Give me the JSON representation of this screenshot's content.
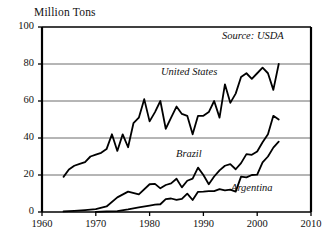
{
  "chart_data": {
    "type": "line",
    "title": "",
    "ylabel": "Million Tons",
    "xlabel": "",
    "annotation": "Source: USDA",
    "xlim": [
      1960,
      2010
    ],
    "ylim": [
      0,
      100
    ],
    "yticks": [
      0,
      20,
      40,
      60,
      80,
      100
    ],
    "xticks": [
      1960,
      1970,
      1980,
      1990,
      2000,
      2010
    ],
    "grid": "horizontal",
    "legend": "inline-labels",
    "series": [
      {
        "name": "United States",
        "x": [
          1964,
          1965,
          1966,
          1967,
          1968,
          1969,
          1970,
          1971,
          1972,
          1973,
          1974,
          1975,
          1976,
          1977,
          1978,
          1979,
          1980,
          1981,
          1982,
          1983,
          1984,
          1985,
          1986,
          1987,
          1988,
          1989,
          1990,
          1991,
          1992,
          1993,
          1994,
          1995,
          1996,
          1997,
          1998,
          1999,
          2000,
          2001,
          2002,
          2003,
          2004
        ],
        "values": [
          19,
          23,
          25,
          26,
          27,
          30,
          31,
          32,
          34,
          42,
          33,
          42,
          35,
          48,
          51,
          61,
          49,
          54,
          60,
          45,
          51,
          57,
          53,
          52,
          42,
          52,
          52,
          54,
          60,
          51,
          69,
          59,
          64,
          73,
          75,
          72,
          75,
          78,
          75,
          66,
          80
        ]
      },
      {
        "name": "Brazil",
        "x": [
          1964,
          1966,
          1968,
          1970,
          1972,
          1974,
          1976,
          1978,
          1980,
          1981,
          1982,
          1983,
          1984,
          1985,
          1986,
          1987,
          1988,
          1989,
          1990,
          1991,
          1992,
          1993,
          1994,
          1995,
          1996,
          1997,
          1998,
          1999,
          2000,
          2001,
          2002,
          2003,
          2004
        ],
        "values": [
          0.3,
          0.6,
          1,
          1.5,
          3,
          7.9,
          11,
          9.5,
          15,
          15.2,
          12.8,
          14.6,
          15.5,
          18,
          13.3,
          16.9,
          18,
          24,
          20,
          15,
          19.2,
          22.5,
          25,
          25.9,
          23.1,
          26.4,
          31.3,
          30.9,
          32.7,
          37.7,
          42,
          52,
          50
        ]
      },
      {
        "name": "Argentina",
        "x": [
          1970,
          1972,
          1974,
          1976,
          1978,
          1980,
          1981,
          1982,
          1983,
          1984,
          1985,
          1986,
          1987,
          1988,
          1989,
          1990,
          1991,
          1992,
          1993,
          1994,
          1995,
          1996,
          1997,
          1998,
          1999,
          2000,
          2001,
          2002,
          2003,
          2004
        ],
        "values": [
          0.1,
          0.3,
          0.5,
          1.4,
          2.5,
          3.5,
          4,
          4.2,
          7,
          7.3,
          6.5,
          7.1,
          9.9,
          6.5,
          10.9,
          11,
          11.3,
          11.3,
          12.4,
          11.7,
          12.1,
          11,
          19.1,
          18.7,
          20,
          20.2,
          26.8,
          30,
          34.8,
          38
        ]
      }
    ]
  },
  "axis_labels": {
    "y": [
      "0",
      "20",
      "40",
      "60",
      "80",
      "100"
    ],
    "x": [
      "1960",
      "1970",
      "1980",
      "1990",
      "2000",
      "2010"
    ]
  },
  "series_labels": {
    "united_states": "United States",
    "brazil": "Brazil",
    "argentina": "Argentina"
  },
  "colors": {
    "line": "#000000",
    "grid": "#6d6d6d",
    "axis": "#000000",
    "background": "#ffffff"
  }
}
